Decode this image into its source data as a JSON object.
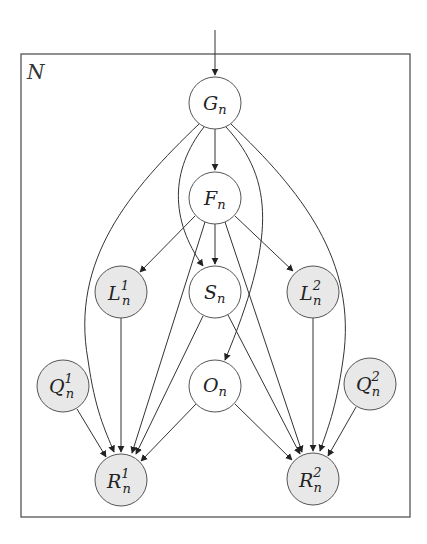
{
  "diagram": {
    "type": "probabilistic-graphical-model",
    "plate": {
      "label": "N",
      "x": 21,
      "y": 54,
      "width": 389,
      "height": 463
    },
    "colors": {
      "observed_fill": "#e8e8e8",
      "latent_fill": "#ffffff",
      "stroke": "#555555"
    },
    "nodes": [
      {
        "id": "G",
        "base": "G",
        "sub": "n",
        "sup": "",
        "x": 215,
        "y": 103,
        "observed": false
      },
      {
        "id": "F",
        "base": "F",
        "sub": "n",
        "sup": "",
        "x": 215,
        "y": 198,
        "observed": false
      },
      {
        "id": "L1",
        "base": "L",
        "sub": "n",
        "sup": "1",
        "x": 121,
        "y": 292,
        "observed": true
      },
      {
        "id": "S",
        "base": "S",
        "sub": "n",
        "sup": "",
        "x": 215,
        "y": 292,
        "observed": false
      },
      {
        "id": "L2",
        "base": "L",
        "sub": "n",
        "sup": "2",
        "x": 313,
        "y": 292,
        "observed": true
      },
      {
        "id": "Q1",
        "base": "Q",
        "sub": "n",
        "sup": "1",
        "x": 63,
        "y": 386,
        "observed": true
      },
      {
        "id": "O",
        "base": "O",
        "sub": "n",
        "sup": "",
        "x": 215,
        "y": 386,
        "observed": false
      },
      {
        "id": "Q2",
        "base": "Q",
        "sub": "n",
        "sup": "2",
        "x": 370,
        "y": 384,
        "observed": true
      },
      {
        "id": "R1",
        "base": "R",
        "sub": "n",
        "sup": "1",
        "x": 121,
        "y": 480,
        "observed": true
      },
      {
        "id": "R2",
        "base": "R",
        "sub": "n",
        "sup": "2",
        "x": 313,
        "y": 479,
        "observed": true
      }
    ],
    "edges": [
      {
        "from": "input",
        "to": "G"
      },
      {
        "from": "G",
        "to": "F"
      },
      {
        "from": "G",
        "to": "S"
      },
      {
        "from": "G",
        "to": "O"
      },
      {
        "from": "G",
        "to": "R1"
      },
      {
        "from": "G",
        "to": "R2"
      },
      {
        "from": "F",
        "to": "L1"
      },
      {
        "from": "F",
        "to": "S"
      },
      {
        "from": "F",
        "to": "L2"
      },
      {
        "from": "F",
        "to": "R1"
      },
      {
        "from": "F",
        "to": "R2"
      },
      {
        "from": "L1",
        "to": "R1"
      },
      {
        "from": "L2",
        "to": "R2"
      },
      {
        "from": "S",
        "to": "R1"
      },
      {
        "from": "S",
        "to": "R2"
      },
      {
        "from": "Q1",
        "to": "R1"
      },
      {
        "from": "Q2",
        "to": "R2"
      },
      {
        "from": "O",
        "to": "R1"
      },
      {
        "from": "O",
        "to": "R2"
      }
    ]
  },
  "labels": {
    "plate": "N",
    "G": {
      "base": "G",
      "sub": "n"
    },
    "F": {
      "base": "F",
      "sub": "n"
    },
    "L1": {
      "base": "L",
      "sub": "n",
      "sup": "1"
    },
    "S": {
      "base": "S",
      "sub": "n"
    },
    "L2": {
      "base": "L",
      "sub": "n",
      "sup": "2"
    },
    "Q1": {
      "base": "Q",
      "sub": "n",
      "sup": "1"
    },
    "O": {
      "base": "O",
      "sub": "n"
    },
    "Q2": {
      "base": "Q",
      "sub": "n",
      "sup": "2"
    },
    "R1": {
      "base": "R",
      "sub": "n",
      "sup": "1"
    },
    "R2": {
      "base": "R",
      "sub": "n",
      "sup": "2"
    }
  }
}
